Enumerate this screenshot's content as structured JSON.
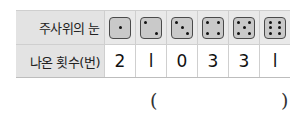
{
  "table": {
    "row_labels": {
      "header": "주사위의 눈",
      "values": "나온 횟수(번)"
    },
    "dice_faces": [
      1,
      2,
      3,
      4,
      5,
      6
    ],
    "dice_icons": [
      "die-face-1-icon",
      "die-face-2-icon",
      "die-face-3-icon",
      "die-face-4-icon",
      "die-face-5-icon",
      "die-face-6-icon"
    ],
    "counts": [
      "2",
      "l",
      "0",
      "3",
      "3",
      "l"
    ]
  },
  "answer": {
    "open_paren": "(",
    "close_paren": ")",
    "value": ""
  },
  "colors": {
    "header_bg": "#e9e9e9",
    "die_fill": "#c9c9c9",
    "die_border": "#4a4a4a",
    "pip": "#111111"
  }
}
